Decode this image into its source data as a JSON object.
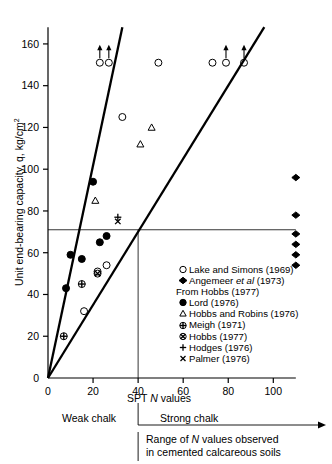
{
  "axes": {
    "y_title": "Unit end-bearing capacity, q, kg/cm",
    "y_title_sup": "2",
    "x_title_pre": "SPT ",
    "x_title_italic": "N",
    "x_title_post": " values",
    "y_ticks": [
      0,
      20,
      40,
      60,
      80,
      100,
      120,
      140,
      160
    ],
    "x_ticks": [
      0,
      20,
      40,
      60,
      80,
      100
    ],
    "xlim": [
      0,
      110
    ],
    "ylim": [
      0,
      168
    ]
  },
  "annotations": {
    "weak_chalk": "Weak chalk",
    "strong_chalk": "Strong chalk",
    "range_line1_pre": "Range of ",
    "range_line1_italic": "N",
    "range_line1_post": " values observed",
    "range_line2": "in cemented calcareous soils",
    "legend_header": "From Hobbs (1977)"
  },
  "legend": [
    {
      "marker": "open-circle",
      "label": "Lake and Simons (1969)"
    },
    {
      "marker": "diamond",
      "label_pre": "Angemeer ",
      "label_italic": "et al",
      "label_post": " (1973)"
    },
    {
      "marker": "header",
      "label": "From Hobbs (1977)"
    },
    {
      "marker": "filled-circle",
      "label": "Lord (1976)"
    },
    {
      "marker": "triangle",
      "label": "Hobbs and Robins (1976)"
    },
    {
      "marker": "circle-plus",
      "label": "Meigh (1971)"
    },
    {
      "marker": "circle-cross",
      "label": "Hobbs (1977)"
    },
    {
      "marker": "plus",
      "label": "Hodges (1976)"
    },
    {
      "marker": "cross",
      "label": "Palmer (1976)"
    }
  ],
  "chart_data": {
    "type": "scatter",
    "title": "",
    "xlabel": "SPT N values",
    "ylabel": "Unit end-bearing capacity, q, kg/cm2",
    "xlim": [
      0,
      110
    ],
    "ylim": [
      0,
      168
    ],
    "grid": false,
    "legend_position": "inside-right-lower",
    "reference_lines": {
      "horizontal_q": 71,
      "vertical_N": 40,
      "upper_bound": {
        "from": [
          0,
          0
        ],
        "to": [
          33,
          168
        ],
        "description": "steep upper bound through origin"
      },
      "lower_bound": {
        "from": [
          0,
          0
        ],
        "to": [
          96,
          168
        ],
        "description": "shallow lower bound through origin"
      }
    },
    "series": [
      {
        "name": "Lake and Simons (1969)",
        "marker": "open-circle",
        "points": [
          {
            "x": 23,
            "y": 151,
            "arrow": "up"
          },
          {
            "x": 27,
            "y": 151,
            "arrow": "up"
          },
          {
            "x": 49,
            "y": 151
          },
          {
            "x": 73,
            "y": 151
          },
          {
            "x": 79,
            "y": 151,
            "arrow": "up"
          },
          {
            "x": 87,
            "y": 151,
            "arrow": "up"
          },
          {
            "x": 33,
            "y": 125
          },
          {
            "x": 26,
            "y": 54
          },
          {
            "x": 22,
            "y": 51
          },
          {
            "x": 16,
            "y": 32
          }
        ]
      },
      {
        "name": "Angemeer et al (1973)",
        "marker": "diamond",
        "points": [
          {
            "x": 110,
            "y": 96
          },
          {
            "x": 110,
            "y": 78
          },
          {
            "x": 110,
            "y": 69
          },
          {
            "x": 110,
            "y": 64
          },
          {
            "x": 110,
            "y": 59
          },
          {
            "x": 110,
            "y": 54
          }
        ]
      },
      {
        "name": "Lord (1976)",
        "marker": "filled-circle",
        "points": [
          {
            "x": 20,
            "y": 94
          },
          {
            "x": 26,
            "y": 68
          },
          {
            "x": 23,
            "y": 65
          },
          {
            "x": 10,
            "y": 59
          },
          {
            "x": 15,
            "y": 57
          },
          {
            "x": 8,
            "y": 43
          }
        ]
      },
      {
        "name": "Hobbs and Robins (1976)",
        "marker": "triangle",
        "points": [
          {
            "x": 21,
            "y": 85
          },
          {
            "x": 41,
            "y": 112
          },
          {
            "x": 46,
            "y": 120
          }
        ]
      },
      {
        "name": "Meigh (1971)",
        "marker": "circle-plus",
        "points": [
          {
            "x": 15,
            "y": 45
          },
          {
            "x": 7,
            "y": 20
          }
        ]
      },
      {
        "name": "Hobbs (1977)",
        "marker": "circle-cross",
        "points": [
          {
            "x": 22,
            "y": 50
          }
        ]
      },
      {
        "name": "Hodges (1976)",
        "marker": "plus",
        "points": [
          {
            "x": 31,
            "y": 77
          }
        ]
      },
      {
        "name": "Palmer (1976)",
        "marker": "cross",
        "points": [
          {
            "x": 31,
            "y": 75
          }
        ]
      }
    ]
  }
}
